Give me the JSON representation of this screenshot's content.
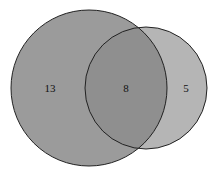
{
  "diagram": {
    "type": "venn",
    "sets": [
      {
        "name": "A",
        "only_count": "13",
        "fill": "#9b9b9b"
      },
      {
        "name": "B",
        "only_count": "5",
        "fill": "#b5b5b5"
      }
    ],
    "intersection": {
      "count": "8",
      "fill": "#8f8f8f"
    },
    "stroke": "#222222"
  }
}
